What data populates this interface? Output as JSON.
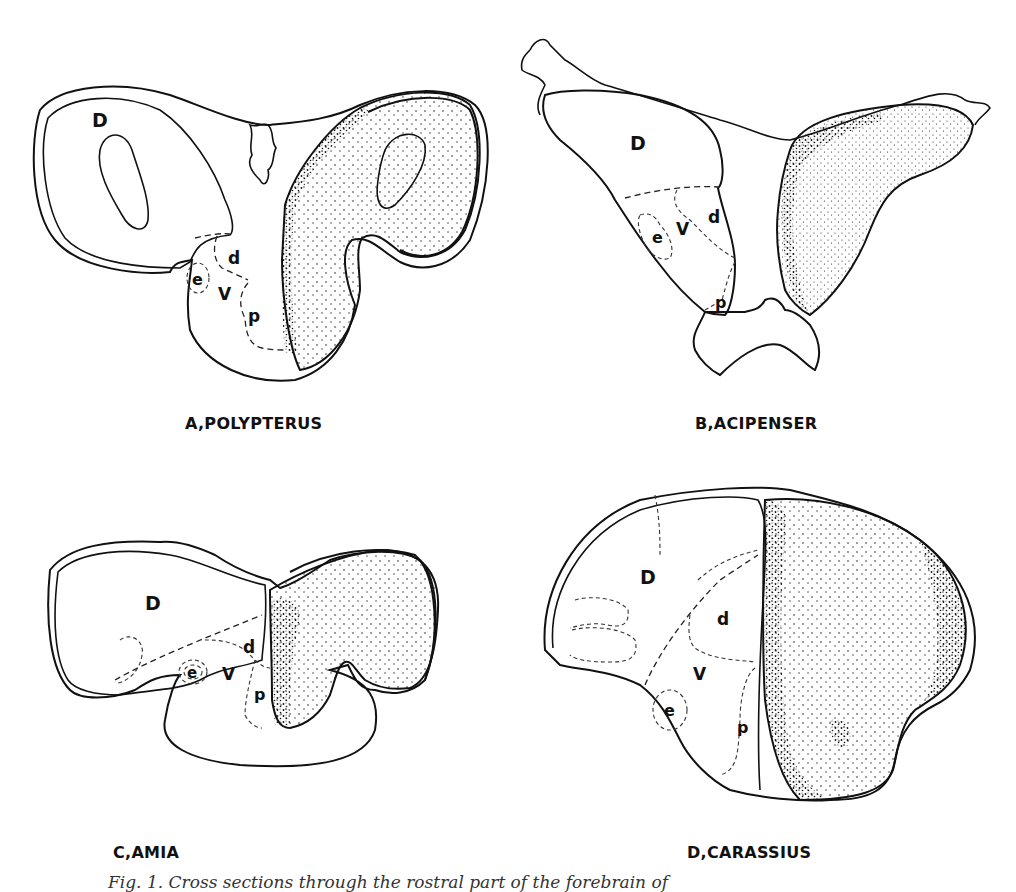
{
  "figure": {
    "panels": [
      {
        "id": "A",
        "title": "A,POLYPTERUS",
        "region_labels": {
          "D": "D",
          "d": "d",
          "V": "V",
          "e": "e",
          "p": "p"
        }
      },
      {
        "id": "B",
        "title": "B,ACIPENSER",
        "region_labels": {
          "D": "D",
          "d": "d",
          "V": "V",
          "e": "e",
          "p": "p"
        }
      },
      {
        "id": "C",
        "title": "C,AMIA",
        "region_labels": {
          "D": "D",
          "d": "d",
          "V": "V",
          "e": "e",
          "p": "p"
        }
      },
      {
        "id": "D",
        "title": "D,CARASSIUS",
        "region_labels": {
          "D": "D",
          "d": "d",
          "V": "V",
          "e": "e",
          "p": "p"
        }
      }
    ],
    "caption": "Fig. 1. Cross sections through the rostral part of the forebrain of"
  }
}
